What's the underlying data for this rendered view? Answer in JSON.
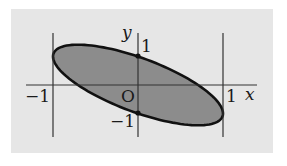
{
  "figure": {
    "background_color": "#e6e6e6",
    "fill_color": "#8c8c8c",
    "stroke_color": "#111111",
    "axis_color": "#333333"
  },
  "labels": {
    "y_axis": "y",
    "x_axis": "x",
    "origin": "O",
    "y_tick_pos": "1",
    "y_tick_neg": "−1",
    "x_tick_pos": "1",
    "x_tick_neg": "−1"
  },
  "chart_data": {
    "type": "region",
    "title": "",
    "curve": "x^2 + (x + y)^2 = 1",
    "xlabel": "x",
    "ylabel": "y",
    "x_ticks": [
      "-1",
      "1"
    ],
    "y_ticks": [
      "-1",
      "1"
    ],
    "vertical_lines": [
      -1,
      1
    ],
    "marked_points": [
      [
        0,
        1
      ],
      [
        0,
        -1
      ]
    ],
    "tangent_points": [
      [
        -1,
        1
      ],
      [
        1,
        -1
      ]
    ],
    "x_intercepts": [
      -0.707,
      0.707
    ],
    "y_intercepts": [
      -1,
      1
    ],
    "xlim": [
      -1.3,
      1.4
    ],
    "ylim": [
      -1.9,
      1.6
    ],
    "grid": false
  },
  "mapping": {
    "origin_px": [
      138,
      85
    ],
    "x_scale": 85,
    "y_scale": 28.5
  }
}
